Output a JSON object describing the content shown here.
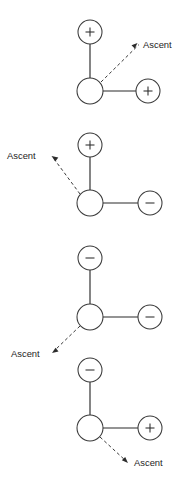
{
  "figure": {
    "title": "",
    "background_color": "#ffffff",
    "line_color": "#2b2b2b",
    "circle_fill": "#ffffff",
    "label_color": "#1d1d1d",
    "ascent_label": "Ascent",
    "panels": [
      {
        "id": "panel-1",
        "center_node": {
          "charge": "",
          "cx": 90,
          "cy": 91,
          "r": 13
        },
        "top_node": {
          "charge": "+",
          "cx": 90,
          "cy": 32,
          "r": 12
        },
        "right_node": {
          "charge": "+",
          "cx": 148,
          "cy": 91,
          "r": 12
        },
        "ascent": {
          "label": "Ascent",
          "direction": "up-right",
          "tail_x": 101,
          "tail_y": 82,
          "tip_x": 138,
          "tip_y": 45,
          "label_x": 143,
          "label_y": 48
        }
      },
      {
        "id": "panel-2",
        "center_node": {
          "charge": "",
          "cx": 90,
          "cy": 203,
          "r": 13
        },
        "top_node": {
          "charge": "+",
          "cx": 90,
          "cy": 145,
          "r": 12
        },
        "right_node": {
          "charge": "−",
          "cx": 150,
          "cy": 203,
          "r": 12
        },
        "ascent": {
          "label": "Ascent",
          "direction": "up-left",
          "tail_x": 80,
          "tail_y": 194,
          "tip_x": 52,
          "tip_y": 157,
          "label_x": 7,
          "label_y": 159
        }
      },
      {
        "id": "panel-3",
        "center_node": {
          "charge": "",
          "cx": 90,
          "cy": 317,
          "r": 13
        },
        "top_node": {
          "charge": "−",
          "cx": 90,
          "cy": 258,
          "r": 12
        },
        "right_node": {
          "charge": "−",
          "cx": 150,
          "cy": 317,
          "r": 12
        },
        "ascent": {
          "label": "Ascent",
          "direction": "down-left",
          "tail_x": 80,
          "tail_y": 326,
          "tip_x": 53,
          "tip_y": 352,
          "label_x": 11,
          "label_y": 357
        }
      },
      {
        "id": "panel-4",
        "center_node": {
          "charge": "",
          "cx": 90,
          "cy": 428,
          "r": 13
        },
        "top_node": {
          "charge": "−",
          "cx": 90,
          "cy": 370,
          "r": 12
        },
        "right_node": {
          "charge": "+",
          "cx": 150,
          "cy": 428,
          "r": 12
        },
        "ascent": {
          "label": "Ascent",
          "direction": "down-right",
          "tail_x": 100,
          "tail_y": 437,
          "tip_x": 127,
          "tip_y": 462,
          "label_x": 134,
          "label_y": 466
        }
      }
    ]
  }
}
